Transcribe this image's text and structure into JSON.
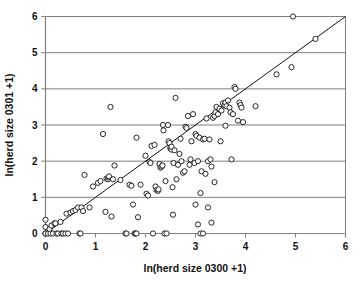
{
  "figure": {
    "width": 359,
    "height": 282,
    "background": "#ffffff"
  },
  "chart_data": {
    "type": "scatter",
    "title": "",
    "xlabel": "ln(herd size 0300 +1)",
    "ylabel": "ln(herd size 0301 +1)",
    "xlim": [
      0,
      6
    ],
    "ylim": [
      0,
      6
    ],
    "xticks": [
      "0",
      "1",
      "2",
      "3",
      "4",
      "5",
      "6"
    ],
    "yticks": [
      "0",
      "1",
      "2",
      "3",
      "4",
      "5",
      "6"
    ],
    "grid": "horizontal",
    "grid_color": "#808080",
    "axis_color": "#808080",
    "legend": "none",
    "marker": {
      "shape": "open-circle",
      "radius": 2.6,
      "edge_color": "#111111",
      "fill_color": "#ffffff",
      "edge_width": 0.9
    },
    "reference_line": {
      "name": "identity-line",
      "equation": "y = x",
      "x": [
        0,
        6
      ],
      "y": [
        0,
        6
      ],
      "color": "#111111",
      "width": 1.0
    },
    "points": [
      [
        0.0,
        0.0
      ],
      [
        0.0,
        0.18
      ],
      [
        0.0,
        0.38
      ],
      [
        0.0,
        0.0
      ],
      [
        0.05,
        0.0
      ],
      [
        0.08,
        0.12
      ],
      [
        0.1,
        0.0
      ],
      [
        0.12,
        0.22
      ],
      [
        0.15,
        0.0
      ],
      [
        0.18,
        0.28
      ],
      [
        0.2,
        0.28
      ],
      [
        0.22,
        0.0
      ],
      [
        0.25,
        0.0
      ],
      [
        0.3,
        0.32
      ],
      [
        0.32,
        0.0
      ],
      [
        0.35,
        0.0
      ],
      [
        0.4,
        0.0
      ],
      [
        0.42,
        0.55
      ],
      [
        0.45,
        0.0
      ],
      [
        0.5,
        0.58
      ],
      [
        0.55,
        0.62
      ],
      [
        0.6,
        0.65
      ],
      [
        0.65,
        0.72
      ],
      [
        0.68,
        0.0
      ],
      [
        0.7,
        0.0
      ],
      [
        0.72,
        0.72
      ],
      [
        0.75,
        0.62
      ],
      [
        0.78,
        1.62
      ],
      [
        0.88,
        0.72
      ],
      [
        0.95,
        1.3
      ],
      [
        1.05,
        1.4
      ],
      [
        1.1,
        1.45
      ],
      [
        1.15,
        2.75
      ],
      [
        1.2,
        0.6
      ],
      [
        1.22,
        1.52
      ],
      [
        1.25,
        1.5
      ],
      [
        1.26,
        1.55
      ],
      [
        1.27,
        1.58
      ],
      [
        1.3,
        3.5
      ],
      [
        1.32,
        0.47
      ],
      [
        1.35,
        1.5
      ],
      [
        1.38,
        1.88
      ],
      [
        1.5,
        1.48
      ],
      [
        1.6,
        0.0
      ],
      [
        1.62,
        0.0
      ],
      [
        1.68,
        1.35
      ],
      [
        1.72,
        1.32
      ],
      [
        1.75,
        0.8
      ],
      [
        1.78,
        0.0
      ],
      [
        1.8,
        0.0
      ],
      [
        1.82,
        0.0
      ],
      [
        1.82,
        2.65
      ],
      [
        1.85,
        0.45
      ],
      [
        1.9,
        1.35
      ],
      [
        2.0,
        2.15
      ],
      [
        2.02,
        1.1
      ],
      [
        2.05,
        1.05
      ],
      [
        2.08,
        1.98
      ],
      [
        2.1,
        1.95
      ],
      [
        2.12,
        2.42
      ],
      [
        2.15,
        0.0
      ],
      [
        2.18,
        2.45
      ],
      [
        2.2,
        1.3
      ],
      [
        2.22,
        1.2
      ],
      [
        2.25,
        1.18
      ],
      [
        2.26,
        1.22
      ],
      [
        2.28,
        1.92
      ],
      [
        2.3,
        1.82
      ],
      [
        2.32,
        1.85
      ],
      [
        2.34,
        1.88
      ],
      [
        2.35,
        3.0
      ],
      [
        2.36,
        2.85
      ],
      [
        2.38,
        0.0
      ],
      [
        2.4,
        1.45
      ],
      [
        2.42,
        0.0
      ],
      [
        2.45,
        3.0
      ],
      [
        2.46,
        2.55
      ],
      [
        2.48,
        2.5
      ],
      [
        2.5,
        2.35
      ],
      [
        2.5,
        2.38
      ],
      [
        2.52,
        2.32
      ],
      [
        2.52,
        2.4
      ],
      [
        2.54,
        1.28
      ],
      [
        2.55,
        0.52
      ],
      [
        2.56,
        1.95
      ],
      [
        2.58,
        2.3
      ],
      [
        2.6,
        3.75
      ],
      [
        2.62,
        1.5
      ],
      [
        2.65,
        1.9
      ],
      [
        2.68,
        2.2
      ],
      [
        2.7,
        2.62
      ],
      [
        2.72,
        2.0
      ],
      [
        2.75,
        1.68
      ],
      [
        2.78,
        1.72
      ],
      [
        2.8,
        2.95
      ],
      [
        2.82,
        2.92
      ],
      [
        2.85,
        3.25
      ],
      [
        2.88,
        1.9
      ],
      [
        2.9,
        2.05
      ],
      [
        2.92,
        2.55
      ],
      [
        2.95,
        3.3
      ],
      [
        2.98,
        1.95
      ],
      [
        3.0,
        0.8
      ],
      [
        3.0,
        2.75
      ],
      [
        3.02,
        2.7
      ],
      [
        3.05,
        0.25
      ],
      [
        3.05,
        2.0
      ],
      [
        3.08,
        2.65
      ],
      [
        3.1,
        1.12
      ],
      [
        3.1,
        0.0
      ],
      [
        3.12,
        1.72
      ],
      [
        3.15,
        0.0
      ],
      [
        3.15,
        2.6
      ],
      [
        3.18,
        2.62
      ],
      [
        3.2,
        1.65
      ],
      [
        3.22,
        3.18
      ],
      [
        3.25,
        0.72
      ],
      [
        3.25,
        2.0
      ],
      [
        3.28,
        2.6
      ],
      [
        3.3,
        2.05
      ],
      [
        3.32,
        0.3
      ],
      [
        3.32,
        1.85
      ],
      [
        3.35,
        3.2
      ],
      [
        3.38,
        1.42
      ],
      [
        3.38,
        3.25
      ],
      [
        3.4,
        3.35
      ],
      [
        3.42,
        3.5
      ],
      [
        3.45,
        3.3
      ],
      [
        3.48,
        3.45
      ],
      [
        3.5,
        2.55
      ],
      [
        3.52,
        3.4
      ],
      [
        3.55,
        3.6
      ],
      [
        3.58,
        3.55
      ],
      [
        3.6,
        2.98
      ],
      [
        3.6,
        3.62
      ],
      [
        3.62,
        3.52
      ],
      [
        3.65,
        3.68
      ],
      [
        3.68,
        3.48
      ],
      [
        3.7,
        3.35
      ],
      [
        3.72,
        2.05
      ],
      [
        3.75,
        3.3
      ],
      [
        3.78,
        4.05
      ],
      [
        3.8,
        4.0
      ],
      [
        3.85,
        3.12
      ],
      [
        3.88,
        3.62
      ],
      [
        3.9,
        3.55
      ],
      [
        3.92,
        3.48
      ],
      [
        3.95,
        3.08
      ],
      [
        4.2,
        3.52
      ],
      [
        4.62,
        4.4
      ],
      [
        4.92,
        4.6
      ],
      [
        4.95,
        6.0
      ],
      [
        5.4,
        5.38
      ]
    ]
  }
}
